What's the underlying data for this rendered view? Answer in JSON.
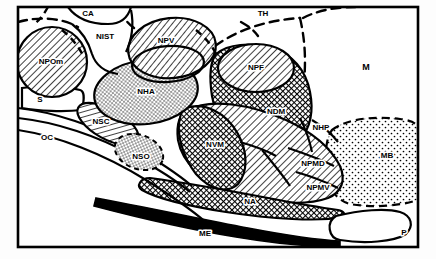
{
  "figure": {
    "kind": "sagittal-hypothalamus-schematic",
    "frame": {
      "stroke": "#000000",
      "fill": "#ffffff",
      "stroke_width": 2
    },
    "colors": {
      "ink": "#000000",
      "paper": "#ffffff",
      "page": "#fdfdfd",
      "hatch": "#000000",
      "stipple": "#000000",
      "solid_black": "#000000"
    },
    "patterns": [
      "hatch-light",
      "hatch-dark",
      "crosshatch-dark",
      "stipple-fine",
      "stipple-coarse",
      "solid-black",
      "blank"
    ]
  },
  "regions": [
    {
      "id": "CA",
      "label": "CA",
      "x": 88,
      "y": 14,
      "size": "lbl-sm",
      "fill": "blank",
      "outline": "solid",
      "note": "commissura anterior"
    },
    {
      "id": "NIST",
      "label": "NIST",
      "x": 105,
      "y": 37,
      "size": "lbl-sm",
      "fill": "blank",
      "outline": "solid",
      "note": "nucleus interstitialis striae terminalis"
    },
    {
      "id": "NPOm",
      "label": "NPOm",
      "x": 51,
      "y": 62,
      "size": "lbl-sm",
      "fill": "hatch-light",
      "outline": "solid",
      "note": "nucleus preopticus medialis"
    },
    {
      "id": "NPV",
      "label": "NPV",
      "x": 166,
      "y": 41,
      "size": "lbl-sm",
      "fill": "hatch-light",
      "outline": "solid",
      "note": "nucleus paraventricularis"
    },
    {
      "id": "NHA",
      "label": "NHA",
      "x": 146,
      "y": 92,
      "size": "lbl-sm",
      "fill": "stipple-fine",
      "outline": "solid",
      "note": "nucleus hypothalamicus anterior"
    },
    {
      "id": "S",
      "label": "S",
      "x": 40,
      "y": 100,
      "size": "lbl-sm",
      "fill": "blank",
      "outline": "solid",
      "note": "septum"
    },
    {
      "id": "OC",
      "label": "OC",
      "x": 47,
      "y": 138,
      "size": "lbl-sm",
      "fill": "blank",
      "outline": "solid",
      "note": "optic chiasm"
    },
    {
      "id": "NSC",
      "label": "NSC",
      "x": 101,
      "y": 122,
      "size": "lbl-sm",
      "fill": "hatch-light",
      "outline": "solid",
      "note": "nucleus suprachiasmaticus"
    },
    {
      "id": "NSO",
      "label": "NSO",
      "x": 141,
      "y": 157,
      "size": "lbl-sm",
      "fill": "stipple-fine",
      "outline": "dashed",
      "note": "nucleus supraopticus"
    },
    {
      "id": "TH",
      "label": "TH",
      "x": 263,
      "y": 14,
      "size": "lbl-sm",
      "fill": "blank",
      "outline": "dashed",
      "note": "thalamus"
    },
    {
      "id": "NPF",
      "label": "NPF",
      "x": 256,
      "y": 68,
      "size": "lbl-sm",
      "fill": "hatch-light",
      "outline": "solid",
      "note": "nucleus paraventricularis / periventricular"
    },
    {
      "id": "M",
      "label": "M",
      "x": 366,
      "y": 68,
      "size": "lbl-md",
      "fill": "blank",
      "outline": "dashed",
      "note": "mesencephalon"
    },
    {
      "id": "NDM",
      "label": "NDM",
      "x": 276,
      "y": 112,
      "size": "lbl-sm",
      "fill": "crosshatch-dark",
      "outline": "solid",
      "note": "nucleus dorsomedialis"
    },
    {
      "id": "NVM",
      "label": "NVM",
      "x": 215,
      "y": 145,
      "size": "lbl-sm",
      "fill": "crosshatch-dark",
      "outline": "solid",
      "note": "nucleus ventromedialis"
    },
    {
      "id": "NHP",
      "label": "NHP",
      "x": 321,
      "y": 128,
      "size": "lbl-sm",
      "fill": "hatch-light",
      "outline": "solid",
      "note": "nucleus hypothalamicus posterior"
    },
    {
      "id": "MB",
      "label": "MB",
      "x": 387,
      "y": 156,
      "size": "lbl-sm",
      "fill": "stipple-coarse",
      "outline": "dashed",
      "note": "mesencephalic / mammillary body region"
    },
    {
      "id": "NPMD",
      "label": "NPMD",
      "x": 313,
      "y": 164,
      "size": "lbl-sm",
      "fill": "hatch-light",
      "outline": "solid",
      "note": "nucleus premammillaris dorsalis"
    },
    {
      "id": "NPMV",
      "label": "NPMV",
      "x": 318,
      "y": 188,
      "size": "lbl-sm",
      "fill": "hatch-light",
      "outline": "solid",
      "note": "nucleus premammillaris ventralis"
    },
    {
      "id": "NA",
      "label": "NA",
      "x": 250,
      "y": 202,
      "size": "lbl-sm",
      "fill": "crosshatch-dark",
      "outline": "solid",
      "note": "nucleus arcuatus / infundibular"
    },
    {
      "id": "ME",
      "label": "ME",
      "x": 205,
      "y": 234,
      "size": "lbl-sm",
      "fill": "solid-black",
      "outline": "solid",
      "note": "median eminence"
    },
    {
      "id": "P",
      "label": "P",
      "x": 404,
      "y": 233,
      "size": "lbl-sm",
      "fill": "blank",
      "outline": "solid",
      "note": "pituitary"
    }
  ]
}
